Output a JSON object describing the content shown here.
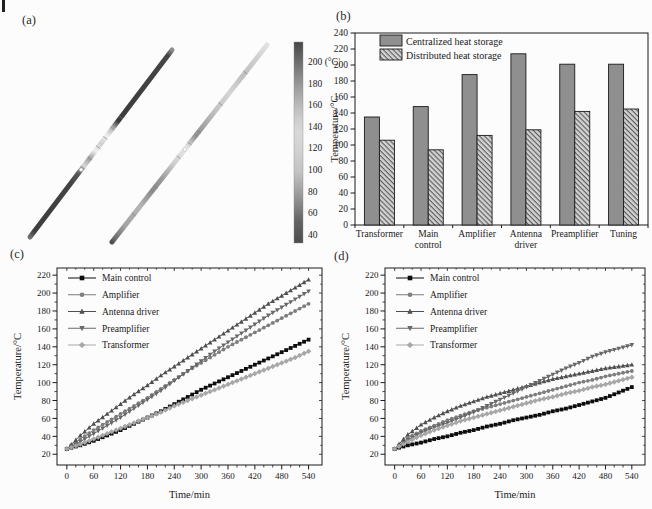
{
  "page": {
    "background": "#fcfcfc",
    "panel_labels": {
      "a": "(a)",
      "b": "(b)",
      "c": "(c)",
      "d": "(d)"
    }
  },
  "panel_a": {
    "description": "infrared thermal image of two diagonal antenna rods",
    "colorbar": {
      "tick_labels": [
        "200 (°C)",
        "180",
        "160",
        "140",
        "120",
        "100",
        "80",
        "60",
        "40"
      ],
      "gradient": [
        [
          0,
          "#474747"
        ],
        [
          0.1,
          "#6e6e6e"
        ],
        [
          0.2,
          "#949494"
        ],
        [
          0.3,
          "#b6b6b6"
        ],
        [
          0.38,
          "#cdcdcd"
        ],
        [
          0.45,
          "#d9d9d9"
        ],
        [
          0.55,
          "#d0d0d0"
        ],
        [
          0.65,
          "#c2c2c2"
        ],
        [
          0.73,
          "#a6a6a6"
        ],
        [
          0.81,
          "#868686"
        ],
        [
          0.89,
          "#646464"
        ],
        [
          1,
          "#4d4d4d"
        ]
      ]
    },
    "rods": [
      {
        "name": "rod-hot-dark",
        "x1": 154,
        "y1": 22,
        "x2": 12,
        "y2": 209,
        "width": 5,
        "dot": 0.64,
        "joints": [
          0.36,
          0.42,
          0.47,
          0.52,
          0.58,
          0.63
        ],
        "stops": [
          [
            0,
            "#8f8f8f"
          ],
          [
            0.03,
            "#454545"
          ],
          [
            0.38,
            "#3c3c3c"
          ],
          [
            0.42,
            "#b9b9b9"
          ],
          [
            0.46,
            "#f0f0f0"
          ],
          [
            0.5,
            "#cfcfcf"
          ],
          [
            0.54,
            "#efefef"
          ],
          [
            0.58,
            "#9f9f9f"
          ],
          [
            0.62,
            "#d8d8d8"
          ],
          [
            0.66,
            "#585858"
          ],
          [
            0.72,
            "#424242"
          ],
          [
            0.97,
            "#3e3e3e"
          ],
          [
            1,
            "#6f6f6f"
          ]
        ]
      },
      {
        "name": "rod-warm-light",
        "x1": 249,
        "y1": 17,
        "x2": 94,
        "y2": 214,
        "width": 5,
        "dot": 0.53,
        "joints": [
          0.14,
          0.3,
          0.44,
          0.5,
          0.57,
          0.72,
          0.86
        ],
        "stops": [
          [
            0,
            "#e2e2e2"
          ],
          [
            0.08,
            "#cdcdcd"
          ],
          [
            0.16,
            "#bfbfbf"
          ],
          [
            0.24,
            "#d5d5d5"
          ],
          [
            0.32,
            "#c7c7c7"
          ],
          [
            0.4,
            "#a8a8a8"
          ],
          [
            0.46,
            "#8f8f8f"
          ],
          [
            0.52,
            "#e8e8e8"
          ],
          [
            0.6,
            "#cfcfcf"
          ],
          [
            0.68,
            "#9a9a9a"
          ],
          [
            0.74,
            "#8a8a8a"
          ],
          [
            0.82,
            "#b5b5b5"
          ],
          [
            0.92,
            "#a2a2a2"
          ],
          [
            0.985,
            "#6a6a6a"
          ],
          [
            1,
            "#4f4f4f"
          ]
        ]
      }
    ]
  },
  "chart_data": [
    {
      "id": "b",
      "type": "bar",
      "ylabel": "Temperature/°C",
      "ylim": [
        0,
        240
      ],
      "yticks": [
        0,
        20,
        40,
        60,
        80,
        100,
        120,
        140,
        160,
        180,
        200,
        220,
        240
      ],
      "categories": [
        [
          "Transformer"
        ],
        [
          "Main",
          "control"
        ],
        [
          "Amplifier"
        ],
        [
          "Antenna",
          "driver"
        ],
        [
          "Preamplifier"
        ],
        [
          "Tuning"
        ]
      ],
      "series": [
        {
          "name": "Centralized heat storage",
          "fill": "solid",
          "color": "#8f8f8f",
          "values": [
            135,
            148,
            188,
            214,
            201,
            201
          ]
        },
        {
          "name": "Distributed heat storage",
          "fill": "hatch",
          "color": "#d2d2d2",
          "hatch_color": "#5a5a5a",
          "values": [
            106,
            94,
            112,
            119,
            142,
            145
          ]
        }
      ],
      "legend_position": "top-left",
      "grid": false
    },
    {
      "id": "c",
      "type": "line",
      "xlabel": "Time/min",
      "ylabel": "Temperature/°C",
      "xlim": [
        -22,
        570
      ],
      "ylim": [
        8,
        228
      ],
      "xticks": [
        0,
        60,
        120,
        180,
        240,
        300,
        360,
        420,
        480,
        540
      ],
      "yticks": [
        20,
        40,
        60,
        80,
        100,
        120,
        140,
        160,
        180,
        200,
        220
      ],
      "x_minor_step": 20,
      "y_minor_step": 10,
      "x": [
        0,
        30,
        60,
        90,
        120,
        150,
        180,
        210,
        240,
        270,
        300,
        330,
        360,
        390,
        420,
        450,
        480,
        510,
        540
      ],
      "series": [
        {
          "name": "Main control",
          "marker": "square",
          "color": "#0d0d0d",
          "values": [
            26,
            30,
            35,
            41,
            47,
            54,
            61,
            68,
            76,
            84,
            92,
            99,
            106,
            113,
            120,
            127,
            134,
            141,
            148
          ]
        },
        {
          "name": "Amplifier",
          "marker": "circle",
          "color": "#7d7d7d",
          "values": [
            26,
            37,
            47,
            56,
            65,
            74,
            83,
            93,
            103,
            113,
            122,
            131,
            140,
            148,
            156,
            164,
            172,
            180,
            188
          ]
        },
        {
          "name": "Antenna driver",
          "marker": "triangle-up",
          "color": "#4f4f4f",
          "values": [
            26,
            41,
            54,
            65,
            76,
            87,
            97,
            108,
            118,
            128,
            138,
            148,
            158,
            168,
            178,
            188,
            197,
            206,
            215
          ]
        },
        {
          "name": "Preamplifier",
          "marker": "triangle-down",
          "color": "#686868",
          "values": [
            26,
            34,
            43,
            52,
            61,
            71,
            81,
            91,
            102,
            113,
            124,
            135,
            145,
            155,
            165,
            175,
            184,
            193,
            202
          ]
        },
        {
          "name": "Transformer",
          "marker": "diamond",
          "color": "#a8a8a8",
          "values": [
            26,
            31,
            37,
            43,
            49,
            55,
            61,
            67,
            74,
            80,
            86,
            92,
            98,
            104,
            110,
            116,
            122,
            128,
            135
          ]
        }
      ],
      "legend_position": "top-left",
      "grid": false,
      "marker_substeps": 3
    },
    {
      "id": "d",
      "type": "line",
      "xlabel": "Time/min",
      "ylabel": "Temperature/°C",
      "xlim": [
        -22,
        570
      ],
      "ylim": [
        8,
        228
      ],
      "xticks": [
        0,
        60,
        120,
        180,
        240,
        300,
        360,
        420,
        480,
        540
      ],
      "yticks": [
        20,
        40,
        60,
        80,
        100,
        120,
        140,
        160,
        180,
        200,
        220
      ],
      "x_minor_step": 20,
      "y_minor_step": 10,
      "x": [
        0,
        30,
        60,
        90,
        120,
        150,
        180,
        210,
        240,
        270,
        300,
        330,
        360,
        390,
        420,
        450,
        480,
        510,
        540
      ],
      "series": [
        {
          "name": "Main control",
          "marker": "square",
          "color": "#0d0d0d",
          "values": [
            26,
            30,
            33,
            37,
            40,
            44,
            47,
            51,
            54,
            58,
            61,
            64,
            68,
            71,
            75,
            79,
            83,
            89,
            95
          ]
        },
        {
          "name": "Amplifier",
          "marker": "circle",
          "color": "#7d7d7d",
          "values": [
            26,
            38,
            46,
            52,
            58,
            63,
            68,
            72,
            76,
            80,
            84,
            88,
            92,
            96,
            100,
            103,
            107,
            110,
            113
          ]
        },
        {
          "name": "Antenna driver",
          "marker": "triangle-up",
          "color": "#4f4f4f",
          "values": [
            26,
            42,
            53,
            61,
            68,
            74,
            79,
            84,
            88,
            92,
            96,
            100,
            104,
            107,
            110,
            113,
            116,
            118,
            120
          ]
        },
        {
          "name": "Preamplifier",
          "marker": "triangle-down",
          "color": "#686868",
          "values": [
            26,
            36,
            44,
            50,
            55,
            61,
            67,
            74,
            81,
            88,
            95,
            102,
            109,
            116,
            122,
            129,
            134,
            138,
            142
          ]
        },
        {
          "name": "Transformer",
          "marker": "diamond",
          "color": "#a8a8a8",
          "values": [
            26,
            34,
            41,
            47,
            52,
            57,
            61,
            65,
            69,
            73,
            77,
            81,
            84,
            88,
            91,
            95,
            98,
            102,
            106
          ]
        }
      ],
      "legend_position": "top-left",
      "grid": false,
      "marker_substeps": 3
    }
  ]
}
